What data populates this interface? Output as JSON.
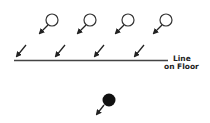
{
  "diagram": {
    "label_line1": "Line",
    "label_line2": "on Floor",
    "colors": {
      "stroke": "#333333",
      "fill_dark": "#111111",
      "background": "#ffffff"
    },
    "open_markers": [
      {
        "cx": 52,
        "cy": 20,
        "r": 6
      },
      {
        "cx": 90,
        "cy": 20,
        "r": 6
      },
      {
        "cx": 128,
        "cy": 20,
        "r": 6
      },
      {
        "cx": 166,
        "cy": 20,
        "r": 6
      }
    ],
    "floor_arrows": [
      {
        "x1": 26,
        "y1": 44,
        "x2": 16,
        "y2": 56
      },
      {
        "x1": 66,
        "y1": 44,
        "x2": 56,
        "y2": 56
      },
      {
        "x1": 105,
        "y1": 44,
        "x2": 95,
        "y2": 56
      },
      {
        "x1": 145,
        "y1": 44,
        "x2": 135,
        "y2": 56
      }
    ],
    "floor_line": {
      "x1": 14,
      "y1": 60,
      "x2": 168,
      "y2": 60
    },
    "filled_marker": {
      "cx": 109,
      "cy": 100,
      "r": 6
    }
  }
}
